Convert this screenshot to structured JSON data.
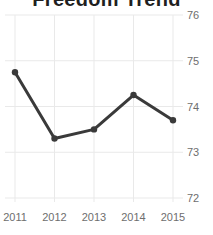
{
  "chart_data": {
    "type": "line",
    "title": "Freedom Trend",
    "title_clipped_at_top": true,
    "categories": [
      "2011",
      "2012",
      "2013",
      "2014",
      "2015"
    ],
    "values": [
      74.75,
      73.3,
      73.5,
      74.25,
      73.7
    ],
    "xlabel": "",
    "ylabel": "",
    "ylim": [
      72,
      76
    ],
    "yticks": [
      76,
      75,
      74,
      73,
      72
    ],
    "ytick_side": "right",
    "grid": true,
    "legend": "none",
    "marker": "circle",
    "colors": {
      "line": "#3a3a3a",
      "marker": "#3a3a3a",
      "grid": "#e9e9e9",
      "tick_label": "#6e6e6e",
      "title": "#1f1f1f",
      "background": "#ffffff"
    }
  }
}
